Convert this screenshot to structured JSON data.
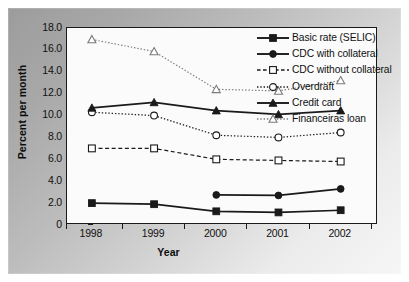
{
  "chart_data": {
    "type": "line",
    "title": "",
    "xlabel": "Year",
    "ylabel": "Percent per month",
    "categories": [
      "1998",
      "1999",
      "2000",
      "2001",
      "2002"
    ],
    "x": [
      1998,
      1999,
      2000,
      2001,
      2002
    ],
    "xlim": [
      1997.6,
      2002.6
    ],
    "ylim": [
      0,
      18
    ],
    "yticks": [
      "0",
      "2.0",
      "4.0",
      "6.0",
      "8.0",
      "10.0",
      "12.0",
      "14.0",
      "16.0",
      "18.0"
    ],
    "ytick_values": [
      0,
      2,
      4,
      6,
      8,
      10,
      12,
      14,
      16,
      18
    ],
    "grid": false,
    "legend_position": "upper right",
    "series": [
      {
        "name": "Basic rate (SELIC)",
        "marker": "filled-square",
        "line": "solid",
        "color": "#1a1a1a",
        "values": [
          2.0,
          1.9,
          1.25,
          1.15,
          1.35
        ]
      },
      {
        "name": "CDC with collateral",
        "marker": "filled-circle",
        "line": "solid",
        "color": "#1a1a1a",
        "values": [
          null,
          null,
          2.75,
          2.7,
          3.3
        ]
      },
      {
        "name": "CDC without collateral",
        "marker": "open-square",
        "line": "dashed",
        "color": "#1a1a1a",
        "values": [
          7.0,
          7.0,
          6.0,
          5.9,
          5.8
        ]
      },
      {
        "name": "Overdraft",
        "marker": "open-circle",
        "line": "dotted",
        "color": "#1a1a1a",
        "values": [
          10.3,
          10.0,
          8.2,
          8.0,
          8.45
        ]
      },
      {
        "name": "Credit card",
        "marker": "filled-triangle",
        "line": "solid",
        "color": "#1a1a1a",
        "values": [
          10.7,
          11.2,
          10.45,
          10.1,
          10.45
        ]
      },
      {
        "name": "Financeiras loan",
        "marker": "open-triangle",
        "line": "dotted",
        "color": "#7a7a7a",
        "values": [
          16.95,
          15.85,
          12.4,
          12.25,
          13.2
        ]
      }
    ]
  },
  "legend": {
    "items": [
      "Basic rate (SELIC)",
      "CDC with collateral",
      "CDC without collateral",
      "Overdraft",
      "Credit card",
      "Financeiras loan"
    ]
  },
  "colors": {
    "axis": "#1a1a1a",
    "plot_background": "#fbfbfb",
    "panel_dark": "#9c9c9c",
    "panel_light": "#f6f6f6",
    "series_dark": "#1a1a1a",
    "series_gray": "#7a7a7a"
  }
}
